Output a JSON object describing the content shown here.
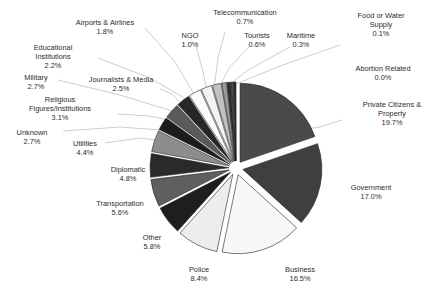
{
  "chart_data": {
    "type": "pie",
    "title": "",
    "subtitle": "",
    "xlabel": "",
    "ylabel": "",
    "legend_position": "none",
    "grid": false,
    "value_unit": "%",
    "start_angle_deg": 0,
    "direction": "clockwise",
    "exploded": true,
    "categories": [
      "Private Citizens & Property",
      "Government",
      "Business",
      "Police",
      "Other",
      "Transportation",
      "Diplomatic",
      "Utilities",
      "Unknown",
      "Religious Figures/Institutions",
      "Military",
      "Journalists & Media",
      "Educational Institutions",
      "Airports & Airlines",
      "NGO",
      "Telecommunication",
      "Tourists",
      "Maritime",
      "Food or Water Supply",
      "Abortion Related"
    ],
    "values": [
      19.7,
      17.0,
      16.5,
      8.4,
      5.8,
      5.6,
      4.8,
      4.4,
      2.7,
      3.1,
      2.7,
      2.5,
      2.2,
      1.8,
      1.0,
      0.7,
      0.6,
      0.3,
      0.1,
      0.0
    ],
    "colors": [
      "#4a4a4a",
      "#3f3f3f",
      "#f7f7f7",
      "#ededed",
      "#1e1e1e",
      "#5f5f5f",
      "#2a2a2a",
      "#8d8d8d",
      "#1c1c1c",
      "#5a5a5a",
      "#272727",
      "#fbfbfb",
      "#f2f2f2",
      "#c2c2c2",
      "#9a9a9a",
      "#2e2e2e",
      "#474747",
      "#1a1a1a",
      "#353535",
      "#111111"
    ],
    "slices": [
      {
        "label": "Private Citizens & Property",
        "value": 19.7,
        "display_value": "19.7%",
        "color": "#4a4a4a",
        "label_lines": [
          "Private Citizens &",
          "Property",
          "19.7%"
        ],
        "label_x": 392,
        "label_y": 107,
        "label_anchor": "middle",
        "leader": [
          [
            342,
            120
          ],
          [
            320,
            127
          ],
          [
            285,
            132
          ]
        ]
      },
      {
        "label": "Government",
        "value": 17.0,
        "display_value": "17.0%",
        "color": "#3f3f3f",
        "label_lines": [
          "Government",
          "17.0%"
        ],
        "label_x": 371,
        "label_y": 190,
        "label_anchor": "middle",
        "leader": []
      },
      {
        "label": "Business",
        "value": 16.5,
        "display_value": "16.5%",
        "color": "#f7f7f7",
        "label_lines": [
          "Business",
          "16.5%"
        ],
        "label_x": 300,
        "label_y": 272,
        "label_anchor": "middle",
        "leader": []
      },
      {
        "label": "Police",
        "value": 8.4,
        "display_value": "8.4%",
        "color": "#ededed",
        "label_lines": [
          "Police",
          "8.4%"
        ],
        "label_x": 199,
        "label_y": 272,
        "label_anchor": "middle",
        "leader": []
      },
      {
        "label": "Other",
        "value": 5.8,
        "display_value": "5.8%",
        "color": "#1e1e1e",
        "label_lines": [
          "Other",
          "5.8%"
        ],
        "label_x": 152,
        "label_y": 240,
        "label_anchor": "middle",
        "leader": []
      },
      {
        "label": "Transportation",
        "value": 5.6,
        "display_value": "5.6%",
        "color": "#5f5f5f",
        "label_lines": [
          "Transportation",
          "5.6%"
        ],
        "label_x": 120,
        "label_y": 206,
        "label_anchor": "middle",
        "leader": []
      },
      {
        "label": "Diplomatic",
        "value": 4.8,
        "display_value": "4.8%",
        "color": "#2a2a2a",
        "label_lines": [
          "Diplomatic",
          "4.8%"
        ],
        "label_x": 128,
        "label_y": 172,
        "label_anchor": "middle",
        "leader": []
      },
      {
        "label": "Utilities",
        "value": 4.4,
        "display_value": "4.4%",
        "color": "#8d8d8d",
        "label_lines": [
          "Utilities",
          "4.4%"
        ],
        "label_x": 85,
        "label_y": 146,
        "label_anchor": "middle",
        "leader": [
          [
            105,
            143
          ],
          [
            140,
            138
          ],
          [
            163,
            141
          ]
        ]
      },
      {
        "label": "Unknown",
        "value": 2.7,
        "display_value": "2.7%",
        "color": "#1c1c1c",
        "label_lines": [
          "Unknown",
          "2.7%"
        ],
        "label_x": 32,
        "label_y": 135,
        "label_anchor": "middle",
        "leader": [
          [
            63,
            131
          ],
          [
            120,
            127
          ],
          [
            160,
            130
          ]
        ]
      },
      {
        "label": "Religious Figures/Institutions",
        "value": 3.1,
        "display_value": "3.1%",
        "color": "#5a5a5a",
        "label_lines": [
          "Religious",
          "Figures/Institutions",
          "3.1%"
        ],
        "label_x": 60,
        "label_y": 102,
        "label_anchor": "middle",
        "leader": [
          [
            118,
            114
          ],
          [
            150,
            116
          ],
          [
            168,
            120
          ]
        ]
      },
      {
        "label": "Military",
        "value": 2.7,
        "display_value": "2.7%",
        "color": "#272727",
        "label_lines": [
          "Military",
          "2.7%"
        ],
        "label_x": 36,
        "label_y": 80,
        "label_anchor": "middle",
        "leader": [
          [
            58,
            80
          ],
          [
            120,
            95
          ],
          [
            172,
            111
          ]
        ]
      },
      {
        "label": "Journalists & Media",
        "value": 2.5,
        "display_value": "2.5%",
        "color": "#fbfbfb",
        "label_lines": [
          "Journalists & Media",
          "2.5%"
        ],
        "label_x": 121,
        "label_y": 82,
        "label_anchor": "middle",
        "leader": [
          [
            160,
            89
          ],
          [
            172,
            94
          ],
          [
            181,
            104
          ]
        ]
      },
      {
        "label": "Educational Institutions",
        "value": 2.2,
        "display_value": "2.2%",
        "color": "#f2f2f2",
        "label_lines": [
          "Educational",
          "Institutions",
          "2.2%"
        ],
        "label_x": 53,
        "label_y": 50,
        "label_anchor": "middle",
        "leader": [
          [
            98,
            58
          ],
          [
            150,
            78
          ],
          [
            186,
            99
          ]
        ]
      },
      {
        "label": "Airports & Airlines",
        "value": 1.8,
        "display_value": "1.8%",
        "color": "#c2c2c2",
        "label_lines": [
          "Airports & Airlines",
          "1.8%"
        ],
        "label_x": 105,
        "label_y": 25,
        "label_anchor": "middle",
        "leader": [
          [
            145,
            28
          ],
          [
            175,
            62
          ],
          [
            194,
            94
          ]
        ]
      },
      {
        "label": "NGO",
        "value": 1.0,
        "display_value": "1.0%",
        "color": "#9a9a9a",
        "label_lines": [
          "NGO",
          "1.0%"
        ],
        "label_x": 190,
        "label_y": 38,
        "label_anchor": "middle",
        "leader": [
          [
            196,
            46
          ],
          [
            202,
            68
          ],
          [
            207,
            90
          ]
        ]
      },
      {
        "label": "Telecommunication",
        "value": 0.7,
        "display_value": "0.7%",
        "color": "#2e2e2e",
        "label_lines": [
          "Telecommunication",
          "0.7%"
        ],
        "label_x": 245,
        "label_y": 15,
        "label_anchor": "middle",
        "leader": [
          [
            225,
            32
          ],
          [
            218,
            58
          ],
          [
            214,
            88
          ]
        ]
      },
      {
        "label": "Tourists",
        "value": 0.6,
        "display_value": "0.6%",
        "color": "#474747",
        "label_lines": [
          "Tourists",
          "0.6%"
        ],
        "label_x": 257,
        "label_y": 38,
        "label_anchor": "middle",
        "leader": [
          [
            249,
            47
          ],
          [
            229,
            68
          ],
          [
            219,
            88
          ]
        ]
      },
      {
        "label": "Maritime",
        "value": 0.3,
        "display_value": "0.3%",
        "color": "#1a1a1a",
        "label_lines": [
          "Maritime",
          "0.3%"
        ],
        "label_x": 301,
        "label_y": 38,
        "label_anchor": "middle",
        "leader": [
          [
            290,
            47
          ],
          [
            248,
            70
          ],
          [
            226,
            87
          ]
        ]
      },
      {
        "label": "Food or Water Supply",
        "value": 0.1,
        "display_value": "0.1%",
        "color": "#353535",
        "label_lines": [
          "Food or Water",
          "Supply",
          "0.1%"
        ],
        "label_x": 381,
        "label_y": 18,
        "label_anchor": "middle",
        "leader": [
          [
            340,
            45
          ],
          [
            280,
            66
          ],
          [
            231,
            86
          ]
        ]
      },
      {
        "label": "Abortion Related",
        "value": 0.0,
        "display_value": "0.0%",
        "color": "#111111",
        "label_lines": [
          "Abortion Related",
          "0.0%"
        ],
        "label_x": 383,
        "label_y": 71,
        "label_anchor": "middle",
        "leader": []
      }
    ],
    "geometry": {
      "center_x": 236,
      "center_y": 168,
      "radius": 79,
      "explode_offset": 7
    }
  }
}
